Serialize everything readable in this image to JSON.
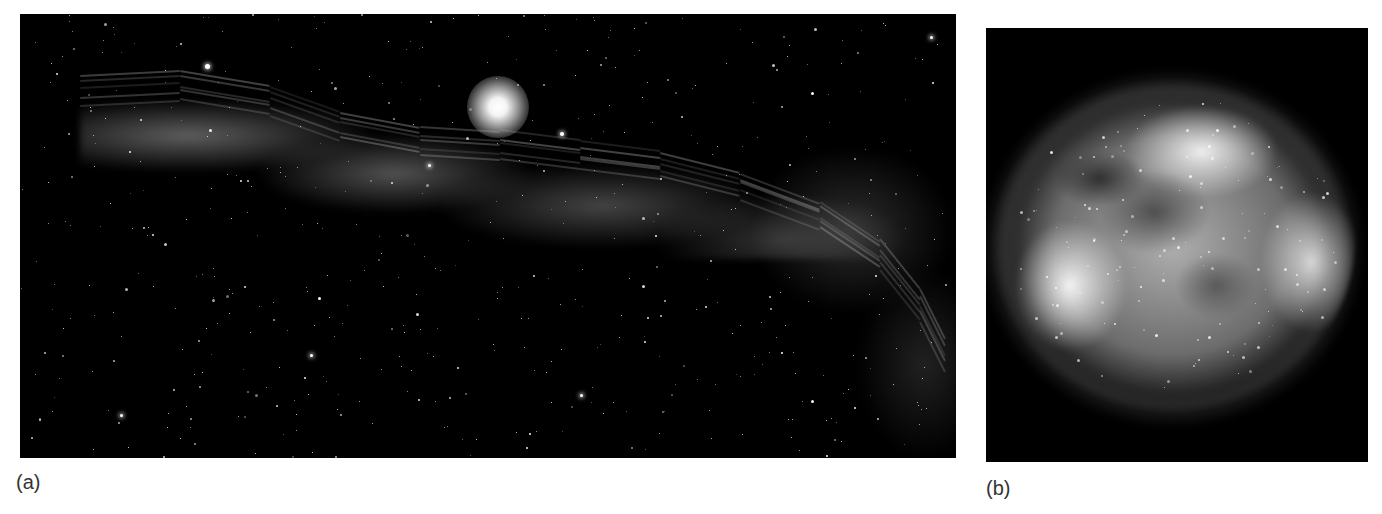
{
  "figure": {
    "background": "#ffffff",
    "panels": [
      {
        "id": "a",
        "label": "(a)",
        "subject": "filamentary-nebula-with-bright-star",
        "background_color": "#000000",
        "bounds": {
          "x": 20,
          "y": 14,
          "width": 936,
          "height": 444
        }
      },
      {
        "id": "b",
        "label": "(b)",
        "subject": "supernova-remnant-shell",
        "background_color": "#000000",
        "bounds": {
          "x": 986,
          "y": 28,
          "width": 382,
          "height": 434
        }
      }
    ]
  }
}
